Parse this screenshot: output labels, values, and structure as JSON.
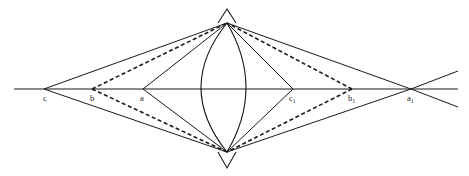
{
  "figure": {
    "title": "",
    "background_color": "#ffffff",
    "stroke_color": "#1a1a1a",
    "width": 469,
    "height": 176,
    "axis": {
      "name": "horizontal-baseline",
      "y": 89,
      "x_start": 14,
      "x_end": 458
    },
    "apex_top": {
      "x": 227,
      "y": 23,
      "peak_y": 9,
      "peak_half_width": 9
    },
    "apex_bottom": {
      "x": 227,
      "y": 152,
      "peak_y": 168,
      "peak_half_width": 9
    },
    "lens": {
      "cx": 227,
      "left_x": 201,
      "right_x": 246
    },
    "points": [
      {
        "id": "c",
        "label": "c",
        "sub": "",
        "x": 44,
        "y": 89,
        "label_x": 43,
        "label_y": 99
      },
      {
        "id": "b",
        "label": "b",
        "sub": "",
        "x": 92,
        "y": 89,
        "label_x": 90,
        "label_y": 99
      },
      {
        "id": "a",
        "label": "a",
        "sub": "",
        "x": 143,
        "y": 89,
        "label_x": 140,
        "label_y": 99
      },
      {
        "id": "c1",
        "label": "c",
        "sub": "1",
        "x": 293,
        "y": 89,
        "label_x": 289,
        "label_y": 99
      },
      {
        "id": "b1",
        "label": "b",
        "sub": "1",
        "x": 352,
        "y": 89,
        "label_x": 348,
        "label_y": 99
      },
      {
        "id": "a1",
        "label": "a",
        "sub": "1",
        "x": 411,
        "y": 89,
        "label_x": 407,
        "label_y": 99
      }
    ],
    "edges": [
      {
        "name": "c-to-top-apex",
        "style": "solid",
        "from": "c",
        "to": "apex_top"
      },
      {
        "name": "c-to-bottom-apex",
        "style": "solid",
        "from": "c",
        "to": "apex_bottom"
      },
      {
        "name": "b-to-top-apex",
        "style": "dashed",
        "from": "b",
        "to": "apex_top"
      },
      {
        "name": "b-to-bottom-apex",
        "style": "dashed",
        "from": "b",
        "to": "apex_bottom"
      },
      {
        "name": "a-to-top-apex",
        "style": "solid",
        "from": "a",
        "to": "apex_top"
      },
      {
        "name": "a-to-bottom-apex",
        "style": "solid",
        "from": "a",
        "to": "apex_bottom"
      },
      {
        "name": "c1-to-top-apex",
        "style": "solid",
        "from": "c1",
        "to": "apex_top"
      },
      {
        "name": "c1-to-bottom-apex",
        "style": "solid",
        "from": "c1",
        "to": "apex_bottom"
      },
      {
        "name": "b1-to-top-apex",
        "style": "dashed",
        "from": "b1",
        "to": "apex_top"
      },
      {
        "name": "b1-to-bottom-apex",
        "style": "dashed",
        "from": "b1",
        "to": "apex_bottom"
      },
      {
        "name": "a1-to-top-apex",
        "style": "solid",
        "from": "a1",
        "to": "apex_top"
      },
      {
        "name": "a1-to-bottom-apex",
        "style": "solid",
        "from": "a1",
        "to": "apex_bottom"
      }
    ],
    "ray_extensions": [
      {
        "name": "upper-right-ray-extension",
        "x1": 411,
        "y1": 89,
        "x2": 458,
        "y2": 71
      },
      {
        "name": "lower-right-ray-extension",
        "x1": 411,
        "y1": 89,
        "x2": 458,
        "y2": 107
      }
    ],
    "lens_arcs": [
      {
        "name": "lens-arc-left",
        "bulge_x": 201
      },
      {
        "name": "lens-arc-right",
        "bulge_x": 246
      }
    ]
  }
}
